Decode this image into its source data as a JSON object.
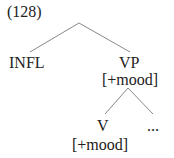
{
  "example_number": "(128)",
  "tree": {
    "root_children": [
      {
        "label": "INFL"
      },
      {
        "label": "VP",
        "feature": "[+mood]",
        "children": [
          {
            "label": "V",
            "feature": "[+mood]"
          },
          {
            "label": "..."
          }
        ]
      }
    ]
  }
}
